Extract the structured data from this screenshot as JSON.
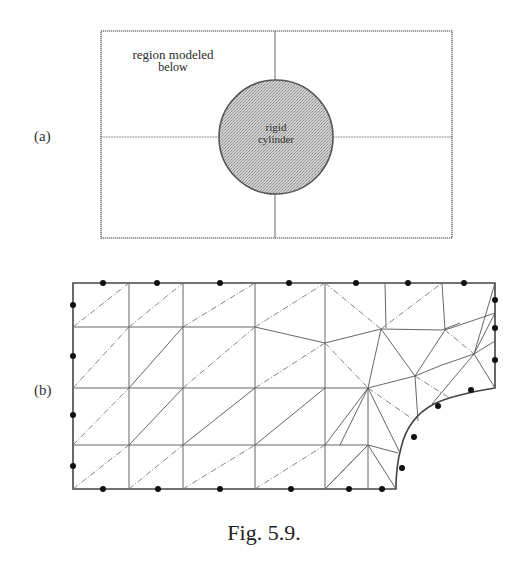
{
  "figure": {
    "caption": "Fig. 5.9.",
    "panel_a": {
      "label": "(a)",
      "region_text_line1": "region modeled",
      "region_text_line2": "below",
      "cylinder_text_line1": "rigid",
      "cylinder_text_line2": "cylinder",
      "box": {
        "x1": 101,
        "y1": 31,
        "x2": 452,
        "y2": 238
      },
      "cylinder": {
        "cx": 276,
        "cy": 137,
        "r": 57,
        "fill": "#c8c8c8"
      },
      "center_lines": {
        "vx": 275,
        "hy": 137
      }
    },
    "panel_b": {
      "label": "(b)",
      "description": "finite element mesh of quarter region with circular hole (rigid cylinder)",
      "outer_boundary": [
        [
          73,
          283
        ],
        [
          495,
          283
        ],
        [
          495,
          388
        ],
        [
          396,
          489
        ],
        [
          73,
          489
        ]
      ],
      "node_color": "#111111",
      "line_color": "#555555"
    }
  }
}
